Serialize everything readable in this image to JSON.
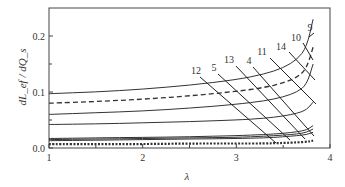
{
  "chart_data": {
    "type": "line",
    "title": "",
    "xlabel": "λ",
    "ylabel": "dL_ef / dQ_s",
    "xlim": [
      1,
      4
    ],
    "ylim": [
      0,
      0.25
    ],
    "xticks": [
      1,
      2,
      3,
      4
    ],
    "xtick_labels": [
      "1",
      "2",
      "3",
      "4"
    ],
    "yticks": [
      0.0,
      0.1,
      0.2
    ],
    "ytick_labels": [
      "0.0",
      "0.1",
      "0.2"
    ],
    "grid": false,
    "legend": "inline numeric labels with leader lines",
    "curve_labels": [
      "12",
      "5",
      "13",
      "4",
      "11",
      "14",
      "10",
      "9"
    ],
    "series": [
      {
        "name": "9",
        "style": "solid",
        "x": [
          1,
          1.5,
          2,
          2.5,
          3,
          3.3,
          3.5,
          3.65,
          3.75,
          3.82
        ],
        "y": [
          0.097,
          0.1,
          0.105,
          0.112,
          0.122,
          0.132,
          0.143,
          0.158,
          0.18,
          0.23
        ]
      },
      {
        "name": "10",
        "style": "dashed",
        "x": [
          1,
          1.5,
          2,
          2.5,
          3,
          3.3,
          3.5,
          3.65,
          3.75,
          3.82
        ],
        "y": [
          0.08,
          0.083,
          0.087,
          0.093,
          0.101,
          0.108,
          0.116,
          0.126,
          0.142,
          0.18
        ]
      },
      {
        "name": "14",
        "style": "solid",
        "x": [
          1,
          1.5,
          2,
          2.5,
          3,
          3.3,
          3.5,
          3.65,
          3.75,
          3.82
        ],
        "y": [
          0.06,
          0.063,
          0.066,
          0.071,
          0.078,
          0.084,
          0.091,
          0.1,
          0.113,
          0.15
        ]
      },
      {
        "name": "11",
        "style": "solid",
        "x": [
          1,
          1.5,
          2,
          2.5,
          3,
          3.3,
          3.5,
          3.65,
          3.75,
          3.82
        ],
        "y": [
          0.042,
          0.043,
          0.045,
          0.047,
          0.05,
          0.053,
          0.057,
          0.062,
          0.068,
          0.082
        ]
      },
      {
        "name": "4",
        "style": "solid",
        "x": [
          1,
          1.5,
          2,
          2.5,
          3,
          3.3,
          3.5,
          3.65,
          3.75,
          3.82
        ],
        "y": [
          0.017,
          0.018,
          0.019,
          0.02,
          0.022,
          0.024,
          0.026,
          0.029,
          0.032,
          0.04
        ]
      },
      {
        "name": "13",
        "style": "solid",
        "x": [
          1,
          1.5,
          2,
          2.5,
          3,
          3.3,
          3.5,
          3.65,
          3.75,
          3.82
        ],
        "y": [
          0.015,
          0.016,
          0.017,
          0.018,
          0.019,
          0.021,
          0.023,
          0.025,
          0.028,
          0.034
        ]
      },
      {
        "name": "5",
        "style": "solid",
        "x": [
          1,
          1.5,
          2,
          2.5,
          3,
          3.3,
          3.5,
          3.65,
          3.75,
          3.82
        ],
        "y": [
          0.013,
          0.014,
          0.015,
          0.016,
          0.017,
          0.018,
          0.02,
          0.022,
          0.024,
          0.028
        ]
      },
      {
        "name": "12",
        "style": "dotted",
        "x": [
          1,
          1.5,
          2,
          2.5,
          3,
          3.3,
          3.5,
          3.65,
          3.75,
          3.82
        ],
        "y": [
          0.007,
          0.007,
          0.007,
          0.008,
          0.008,
          0.008,
          0.009,
          0.01,
          0.011,
          0.013
        ]
      }
    ],
    "annotations": [
      {
        "label": "12",
        "text_pos": [
          196,
          74
        ],
        "line": [
          [
            200,
            77
          ],
          [
            276,
            143
          ]
        ]
      },
      {
        "label": "5",
        "text_pos": [
          214,
          71
        ],
        "line": [
          [
            218,
            74
          ],
          [
            290,
            140
          ]
        ]
      },
      {
        "label": "13",
        "text_pos": [
          229,
          63
        ],
        "line": [
          [
            236,
            66
          ],
          [
            305,
            139
          ]
        ]
      },
      {
        "label": "4",
        "text_pos": [
          249,
          64
        ],
        "line": [
          [
            253,
            67
          ],
          [
            314,
            136
          ]
        ]
      },
      {
        "label": "11",
        "text_pos": [
          262,
          55
        ],
        "line": [
          [
            270,
            58
          ],
          [
            316,
            104
          ]
        ]
      },
      {
        "label": "14",
        "text_pos": [
          281,
          50
        ],
        "line": [
          [
            289,
            52
          ],
          [
            315,
            80
          ]
        ]
      },
      {
        "label": "10",
        "text_pos": [
          296,
          41
        ],
        "line": [
          [
            303,
            43
          ],
          [
            313,
            60
          ]
        ]
      },
      {
        "label": "9",
        "text_pos": [
          310,
          31
        ],
        "line": [
          [
            314,
            33
          ],
          [
            309,
            37
          ]
        ]
      }
    ]
  }
}
